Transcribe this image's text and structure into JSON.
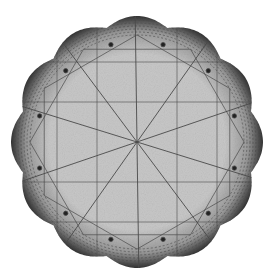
{
  "figure": {
    "center": [
      137,
      142
    ],
    "radius": 126,
    "lobes": 12,
    "colors": {
      "background": "#ffffff",
      "fill": "#c9c9c9",
      "lines": "#4a4a4a",
      "edge": "#2a2a2a"
    }
  }
}
